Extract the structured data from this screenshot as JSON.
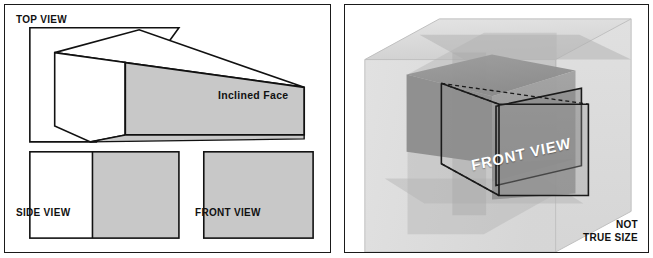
{
  "figure": {
    "background_color": "#ffffff",
    "border_color": "#1a1a1a",
    "fill_gray": "#c8c8c8",
    "line_color": "#111111"
  },
  "ortho_panel": {
    "name": "orthographic-views-panel",
    "top_view": {
      "label": "TOP VIEW",
      "fill": "#ffffff",
      "stroke": "#111111",
      "points": "25,23 175,23 92,138 25,138"
    },
    "side_view": {
      "label": "SIDE VIEW",
      "left_fill": "#ffffff",
      "right_fill": "#c8c8c8",
      "stroke": "#111111",
      "rect": {
        "x": 25,
        "y": 148,
        "width": 150,
        "height": 87
      },
      "split_x": 88
    },
    "front_view": {
      "label": "FRONT VIEW",
      "fill": "#c8c8c8",
      "stroke": "#111111",
      "rect": {
        "x": 200,
        "y": 148,
        "width": 110,
        "height": 87
      }
    },
    "pictorial_block": {
      "label": "Inclined Face",
      "inclined_face_fill": "#c8c8c8",
      "top_face_fill": "#ffffff",
      "left_face_fill": "#ffffff",
      "stroke": "#111111",
      "inclined_face_points": "121,58 301,83 301,131 121,131",
      "top_face_points": "50,48 135,25 301,83 121,58",
      "left_face_points": "50,48 121,58 121,131 86,138 50,122"
    }
  },
  "pictorial_panel": {
    "name": "glass-box-pictorial-panel",
    "front_view_label": "FRONT VIEW",
    "not_true_size_line1": "NOT",
    "not_true_size_line2": "TRUE SIZE",
    "glass_box_fill": "#d6d6d6",
    "glass_box_opacity": 0.55,
    "object_fill": "#9a9a9a",
    "projection_plane_fill": "#b8b8b8",
    "outline_stroke": "#1a1a1a",
    "dashed_stroke": "#1a1a1a"
  }
}
